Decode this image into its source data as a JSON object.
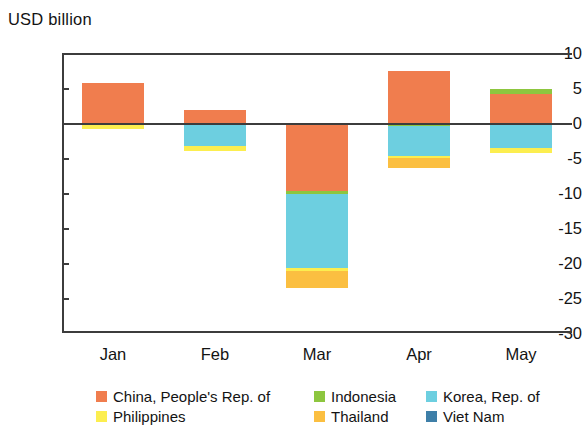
{
  "chart_data": {
    "type": "bar",
    "subtype": "stacked-bar-with-negatives",
    "title": "",
    "ylabel": "USD billion",
    "xlabel": "",
    "ylim": [
      -30,
      10
    ],
    "yticks": [
      10,
      5,
      0,
      -5,
      -10,
      -15,
      -20,
      -25,
      -30
    ],
    "ytick_labels": [
      "10",
      "5",
      "0",
      "-5",
      "-10",
      "-15",
      "-20",
      "-25",
      "-30"
    ],
    "grid": false,
    "legend_position": "bottom",
    "categories": [
      "Jan",
      "Feb",
      "Mar",
      "Apr",
      "May"
    ],
    "series": [
      {
        "name": "China, People's Rep. of",
        "color": "#F07D4E",
        "values": [
          5.7,
          1.8,
          -9.7,
          7.5,
          4.2
        ]
      },
      {
        "name": "Indonesia",
        "color": "#8DC63F",
        "values": [
          0.0,
          0.0,
          -0.4,
          -0.4,
          0.6
        ]
      },
      {
        "name": "Korea, Rep. of",
        "color": "#6DCFE0",
        "values": [
          0.0,
          -3.3,
          -10.6,
          -4.3,
          -3.5
        ]
      },
      {
        "name": "Philippines",
        "color": "#FCEE4F",
        "values": [
          -0.8,
          -0.7,
          -0.4,
          -0.3,
          -0.8
        ]
      },
      {
        "name": "Thailand",
        "color": "#FBBF41",
        "values": [
          0.0,
          0.0,
          -2.5,
          -1.4,
          0.0
        ]
      },
      {
        "name": "Viet Nam",
        "color": "#3E7FA8",
        "values": [
          0.0,
          0.0,
          0.0,
          0.0,
          0.0
        ]
      }
    ],
    "stack_totals_positive": [
      5.7,
      1.8,
      0.0,
      7.5,
      4.8
    ],
    "stack_totals_negative": [
      -0.8,
      -4.0,
      -23.6,
      -6.4,
      -4.3
    ]
  },
  "axis": {
    "y_title": "USD billion",
    "y_ticks": [
      {
        "label": "10",
        "value": 10
      },
      {
        "label": "5",
        "value": 5
      },
      {
        "label": "0",
        "value": 0
      },
      {
        "label": "-5",
        "value": -5
      },
      {
        "label": "-10",
        "value": -10
      },
      {
        "label": "-15",
        "value": -15
      },
      {
        "label": "-20",
        "value": -20
      },
      {
        "label": "-25",
        "value": -25
      },
      {
        "label": "-30",
        "value": -30
      }
    ],
    "x_ticks": [
      {
        "label": "Jan"
      },
      {
        "label": "Feb"
      },
      {
        "label": "Mar"
      },
      {
        "label": "Apr"
      },
      {
        "label": "May"
      }
    ]
  },
  "legend": {
    "rows": [
      [
        {
          "label": "China, People's Rep. of",
          "color": "#F07D4E"
        },
        {
          "label": "Indonesia",
          "color": "#8DC63F"
        },
        {
          "label": "Korea, Rep. of",
          "color": "#6DCFE0"
        }
      ],
      [
        {
          "label": "Philippines",
          "color": "#FCEE4F"
        },
        {
          "label": "Thailand",
          "color": "#FBBF41"
        },
        {
          "label": "Viet Nam",
          "color": "#3E7FA8"
        }
      ]
    ]
  }
}
